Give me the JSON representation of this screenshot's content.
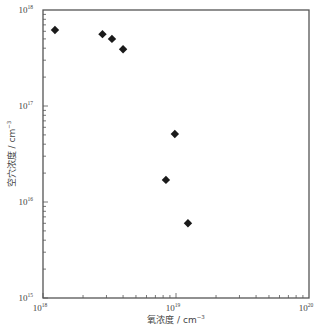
{
  "chart_data": {
    "type": "scatter",
    "title": "",
    "xlabel": "氧浓度 / cm⁻³",
    "ylabel": "空穴浓度 / cm⁻³",
    "xscale": "log",
    "yscale": "log",
    "xlim": [
      1e+18,
      1e+20
    ],
    "ylim": [
      1000000000000000.0,
      1e+18
    ],
    "x_ticks": [
      {
        "base": "10",
        "exp": "18",
        "value": 1e+18
      },
      {
        "base": "10",
        "exp": "19",
        "value": 1e+19
      },
      {
        "base": "10",
        "exp": "20",
        "value": 1e+20
      }
    ],
    "y_ticks": [
      {
        "base": "10",
        "exp": "15",
        "value": 1000000000000000.0
      },
      {
        "base": "10",
        "exp": "16",
        "value": 1e+16
      },
      {
        "base": "10",
        "exp": "17",
        "value": 1e+17
      },
      {
        "base": "10",
        "exp": "18",
        "value": 1e+18
      }
    ],
    "grid": false,
    "legend": null,
    "marker": "diamond",
    "marker_color": "#1a1a1a",
    "series": [
      {
        "name": "data",
        "points": [
          {
            "x": 1.23e+18,
            "y": 6.2e+17
          },
          {
            "x": 2.8e+18,
            "y": 5.6e+17
          },
          {
            "x": 3.3e+18,
            "y": 5e+17
          },
          {
            "x": 4e+18,
            "y": 3.9e+17
          },
          {
            "x": 9.8e+18,
            "y": 5.1e+16
          },
          {
            "x": 8.4e+18,
            "y": 1.7e+16
          },
          {
            "x": 1.23e+19,
            "y": 6000000000000000.0
          }
        ]
      }
    ]
  },
  "axes": {
    "x_title_main": "氧浓度 / cm",
    "x_title_exp": "−3",
    "y_title_main": "空穴浓度 / cm",
    "y_title_exp": "−3"
  }
}
